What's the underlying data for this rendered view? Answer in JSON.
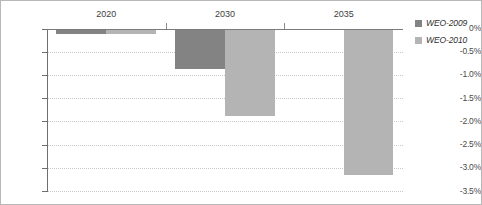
{
  "chart_data": {
    "type": "bar",
    "title": "",
    "subtitle": "",
    "xlabel": "",
    "ylabel": "",
    "categories": [
      "2020",
      "2030",
      "2035"
    ],
    "series": [
      {
        "name": "WEO-2009",
        "color": "#838383",
        "values": [
          -0.12,
          -0.88,
          null
        ]
      },
      {
        "name": "WEO-2010",
        "color": "#b4b4b4",
        "values": [
          -0.12,
          -1.88,
          -3.15
        ]
      }
    ],
    "ylim": [
      -3.5,
      0
    ],
    "ytick_labels": [
      "0%",
      "-0.5%",
      "-1.0%",
      "-1.5%",
      "-2.0%",
      "-2.5%",
      "-3.0%",
      "-3.5%"
    ],
    "ytick_values": [
      0,
      -0.5,
      -1.0,
      -1.5,
      -2.0,
      -2.5,
      -3.0,
      -3.5
    ],
    "grid": true,
    "grid_style": "dotted",
    "legend_position": "right",
    "orientation": "vertical",
    "bars_direction": "downward",
    "category_labels_position": "above-zero-axis"
  },
  "legend": {
    "items": [
      {
        "label": "WEO-2009",
        "swatch": "#838383"
      },
      {
        "label": "WEO-2010",
        "swatch": "#b4b4b4"
      }
    ]
  },
  "colors": {
    "series_2009": "#838383",
    "series_2010": "#b4b4b4",
    "axis": "#6f6f6f",
    "gridline": "#c9c9c9",
    "border": "#b8b8b8",
    "text": "#3d3d3d",
    "background": "#ffffff"
  }
}
